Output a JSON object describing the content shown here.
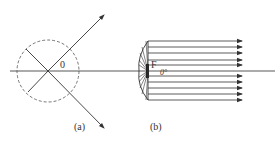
{
  "figure": {
    "panel_a": {
      "label": "(a)",
      "angle_label": "0"
    },
    "panel_b": {
      "label": "(b)",
      "focus_label": "F",
      "angle_label": "0°"
    }
  },
  "colors": {
    "line": "#333333",
    "background": "#ffffff"
  }
}
